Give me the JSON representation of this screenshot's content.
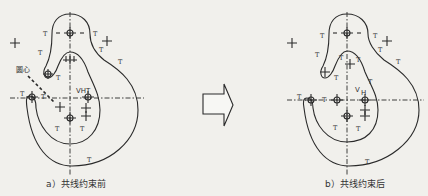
{
  "figure": {
    "panels": [
      {
        "id": "a",
        "caption": "a）共线约束前",
        "annotation": "圆心",
        "labels": {
          "vh": "VHT",
          "constraint": "T",
          "sym": "LLT"
        }
      },
      {
        "id": "b",
        "caption": "b）共线约束后",
        "labels": {
          "vh": "V",
          "vh_sub": "H",
          "constraint": "T",
          "sym": "T T"
        }
      }
    ],
    "arrow": {
      "direction": "right",
      "meaning": "transform"
    },
    "colors": {
      "background": "#f1f0ec",
      "line": "#2a2a2a"
    }
  }
}
